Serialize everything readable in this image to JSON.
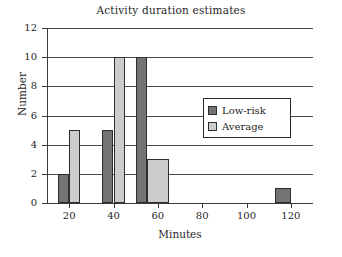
{
  "chart_data": {
    "type": "bar",
    "title": "Activity duration estimates",
    "xlabel": "Minutes",
    "ylabel": "Number",
    "xlim": [
      10,
      130
    ],
    "ylim": [
      0,
      12
    ],
    "xticks": [
      20,
      40,
      60,
      80,
      100,
      120
    ],
    "yticks": [
      0,
      2,
      4,
      6,
      8,
      10,
      12
    ],
    "grid": "horizontal",
    "legend_position": "center-right",
    "series": [
      {
        "name": "Low-risk",
        "color": "#737373",
        "bins": [
          {
            "start": 15,
            "end": 20,
            "value": 2
          },
          {
            "start": 35,
            "end": 40,
            "value": 5
          },
          {
            "start": 50,
            "end": 55,
            "value": 10
          },
          {
            "start": 113,
            "end": 120,
            "value": 1
          }
        ]
      },
      {
        "name": "Average",
        "color": "#cccccc",
        "bins": [
          {
            "start": 20,
            "end": 25,
            "value": 5
          },
          {
            "start": 40,
            "end": 45,
            "value": 10
          },
          {
            "start": 55,
            "end": 65,
            "value": 3
          }
        ]
      }
    ]
  },
  "ytick_labels": [
    "0",
    "2",
    "4",
    "6",
    "8",
    "10",
    "12"
  ],
  "xtick_labels": [
    "20",
    "40",
    "60",
    "80",
    "100",
    "120"
  ],
  "legend": {
    "items": [
      {
        "label": "Low-risk"
      },
      {
        "label": "Average"
      }
    ]
  },
  "colors": {
    "low_risk": "#737373",
    "average": "#cccccc",
    "axis": "#3a3a3a",
    "grid": "#4a4a4a",
    "background": "#ffffff"
  }
}
